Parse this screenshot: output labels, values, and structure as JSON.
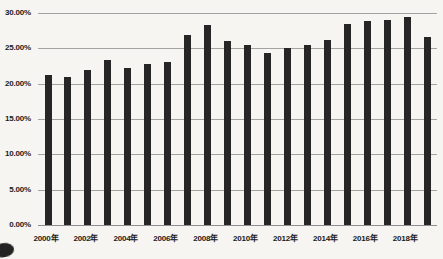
{
  "chart_data": {
    "type": "bar",
    "title": "",
    "xlabel": "",
    "ylabel": "",
    "categories": [
      "2000年",
      "2001年",
      "2002年",
      "2003年",
      "2004年",
      "2005年",
      "2006年",
      "2007年",
      "2008年",
      "2009年",
      "2010年",
      "2011年",
      "2012年",
      "2013年",
      "2014年",
      "2015年",
      "2016年",
      "2017年",
      "2018年",
      "2019年"
    ],
    "values": [
      21.2,
      21.0,
      22.0,
      23.3,
      22.2,
      22.8,
      23.1,
      26.9,
      28.3,
      26.1,
      25.5,
      24.4,
      25.0,
      25.5,
      26.2,
      28.5,
      28.9,
      29.0,
      29.5,
      26.6
    ],
    "ylim": [
      0,
      30
    ],
    "y_tick_labels": [
      "30.00%",
      "25.00%",
      "20.00%",
      "15.00%",
      "10.00%",
      "5.00%",
      "0.00%"
    ],
    "y_tick_values": [
      30,
      25,
      20,
      15,
      10,
      5,
      0
    ],
    "x_tick_labels": [
      "2000年",
      "2002年",
      "2004年",
      "2006年",
      "2008年",
      "2010年",
      "2012年",
      "2014年",
      "2016年",
      "2018年"
    ],
    "x_tick_bar_indices": [
      0,
      2,
      4,
      6,
      8,
      10,
      12,
      14,
      16,
      18
    ],
    "grid": "horizontal",
    "legend": "none",
    "colors": {
      "bar": "#262626",
      "gridline": "#a3a3a3",
      "axis_line": "#8f8f8f",
      "text": "#1b1b1b",
      "background": "#f6f5f1"
    }
  }
}
